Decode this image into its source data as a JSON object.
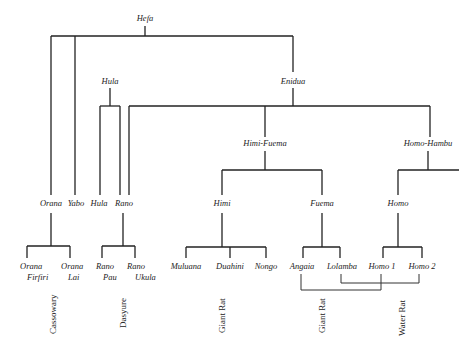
{
  "diagram": {
    "root": "Hefa",
    "level1": {
      "hula": "Hula",
      "enidua": "Enidua"
    },
    "level2": {
      "himi_fuema": "Himi-Fuema",
      "homo_hambu": "Homo-Hambu"
    },
    "level3": {
      "orana": "Orana",
      "yabo": "Yabo",
      "hula": "Hula",
      "rano": "Rano",
      "himi": "Himi",
      "fuema": "Fuema",
      "homo": "Homo"
    },
    "leaves": {
      "orana_firfiri": [
        "Orana",
        "Firfiri"
      ],
      "orana_lai": [
        "Orana",
        "Lai"
      ],
      "rano_pau": [
        "Rano",
        "Pau"
      ],
      "rano_ukula": [
        "Rano",
        "Ukula"
      ],
      "muluana": "Muluana",
      "duahini": "Duahini",
      "nongo": "Nongo",
      "angaia": "Angaia",
      "lolamba": "Lolamba",
      "homo1": "Homo 1",
      "homo2": "Homo 2"
    },
    "groups": {
      "cassowary": "Cassowary",
      "dasyure": "Dasyure",
      "giant_rat_1": "Giant Rat",
      "giant_rat_2": "Giant Rat",
      "water_rat": "Water Rat"
    }
  }
}
